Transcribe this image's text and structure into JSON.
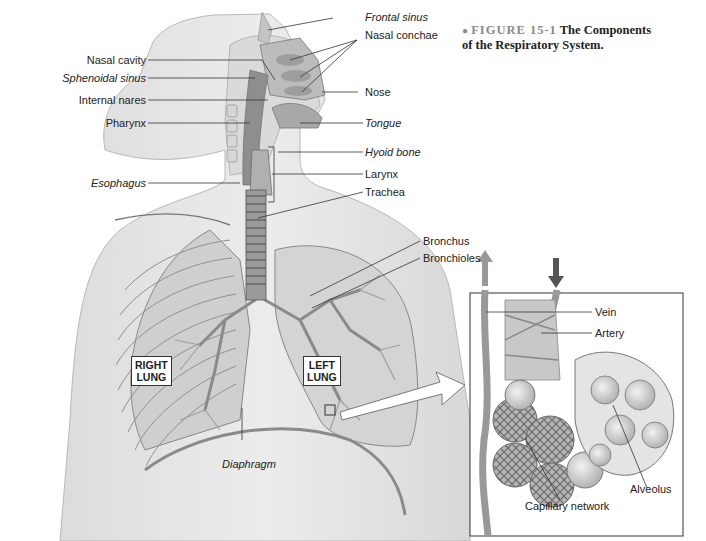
{
  "caption": {
    "bullet": "●",
    "figure_number": "FIGURE 15-1",
    "title": "The Components of the Respiratory System."
  },
  "labels_left": {
    "nasal_cavity": "Nasal cavity",
    "sphenoidal_sinus": "Sphenoidal sinus",
    "internal_nares": "Internal nares",
    "pharynx": "Pharynx",
    "esophagus": "Esophagus"
  },
  "labels_right": {
    "frontal_sinus": "Frontal sinus",
    "nasal_conchae": "Nasal conchae",
    "nose": "Nose",
    "tongue": "Tongue",
    "hyoid_bone": "Hyoid bone",
    "larynx": "Larynx",
    "trachea": "Trachea",
    "bronchus": "Bronchus",
    "bronchioles": "Bronchioles"
  },
  "lungs": {
    "right": "RIGHT\nLUNG",
    "right_line1": "RIGHT",
    "right_line2": "LUNG",
    "left_line1": "LEFT",
    "left_line2": "LUNG"
  },
  "diaphragm": "Diaphragm",
  "inset": {
    "vein": "Vein",
    "artery": "Artery",
    "alveolus": "Alveolus",
    "capillary_network": "Capillary network"
  },
  "colors": {
    "skin": "#e6e6e6",
    "lung": "#d2d2d2",
    "airway": "#9a9a9a",
    "line": "#333333"
  }
}
